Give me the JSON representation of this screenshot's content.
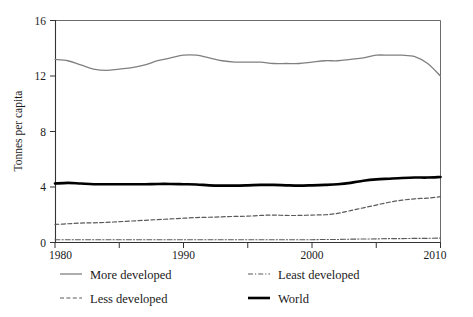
{
  "chart_data": {
    "type": "line",
    "title": "",
    "subtitle": "",
    "xlabel": "",
    "ylabel": "Tonnes per capita",
    "xlim": [
      1980,
      2010
    ],
    "ylim": [
      0,
      16
    ],
    "xticks": [
      1980,
      1985,
      1990,
      1995,
      2000,
      2005,
      2010
    ],
    "xtick_labels": [
      "1980",
      "",
      "1990",
      "",
      "2000",
      "",
      "2010"
    ],
    "yticks": [
      0,
      4,
      8,
      12,
      16
    ],
    "ytick_labels": [
      "0",
      "4",
      "8",
      "12",
      "16"
    ],
    "grid": false,
    "legend_position": "below",
    "x": [
      1980,
      1981,
      1982,
      1983,
      1984,
      1985,
      1986,
      1987,
      1988,
      1989,
      1990,
      1991,
      1992,
      1993,
      1994,
      1995,
      1996,
      1997,
      1998,
      1999,
      2000,
      2001,
      2002,
      2003,
      2004,
      2005,
      2006,
      2007,
      2008,
      2009,
      2010
    ],
    "series": [
      {
        "name": "More developed",
        "style": "solid",
        "color": "#808080",
        "width": 1.3,
        "values": [
          13.2,
          13.1,
          12.8,
          12.5,
          12.4,
          12.5,
          12.6,
          12.8,
          13.1,
          13.3,
          13.5,
          13.5,
          13.3,
          13.1,
          13.0,
          13.0,
          13.0,
          12.9,
          12.9,
          12.9,
          13.0,
          13.1,
          13.1,
          13.2,
          13.3,
          13.5,
          13.5,
          13.5,
          13.4,
          12.9,
          12.0
        ]
      },
      {
        "name": "Less developed",
        "style": "dashed",
        "color": "#5a5a5a",
        "width": 1.2,
        "values": [
          1.3,
          1.35,
          1.4,
          1.42,
          1.45,
          1.5,
          1.55,
          1.6,
          1.65,
          1.7,
          1.75,
          1.8,
          1.82,
          1.85,
          1.88,
          1.9,
          1.95,
          1.98,
          1.95,
          1.95,
          1.98,
          2.0,
          2.1,
          2.3,
          2.5,
          2.7,
          2.9,
          3.05,
          3.15,
          3.2,
          3.3
        ]
      },
      {
        "name": "Least developed",
        "style": "dashdot",
        "color": "#5a5a5a",
        "width": 1.1,
        "values": [
          0.2,
          0.2,
          0.2,
          0.2,
          0.2,
          0.2,
          0.2,
          0.2,
          0.2,
          0.2,
          0.2,
          0.2,
          0.2,
          0.2,
          0.2,
          0.2,
          0.2,
          0.2,
          0.2,
          0.2,
          0.2,
          0.22,
          0.22,
          0.24,
          0.25,
          0.26,
          0.28,
          0.28,
          0.3,
          0.3,
          0.32
        ]
      },
      {
        "name": "World",
        "style": "solid",
        "color": "#000000",
        "width": 2.6,
        "values": [
          4.25,
          4.3,
          4.25,
          4.2,
          4.2,
          4.2,
          4.2,
          4.2,
          4.22,
          4.22,
          4.2,
          4.18,
          4.12,
          4.1,
          4.1,
          4.12,
          4.15,
          4.15,
          4.12,
          4.1,
          4.12,
          4.15,
          4.2,
          4.3,
          4.45,
          4.55,
          4.6,
          4.65,
          4.68,
          4.68,
          4.72
        ]
      }
    ]
  },
  "legend": {
    "items": [
      {
        "label": "More developed",
        "style": "solid",
        "color": "#808080",
        "width": 1.3
      },
      {
        "label": "Least developed",
        "style": "dashdot",
        "color": "#5a5a5a",
        "width": 1.1
      },
      {
        "label": "Less developed",
        "style": "dashed",
        "color": "#5a5a5a",
        "width": 1.2
      },
      {
        "label": "World",
        "style": "solid",
        "color": "#000000",
        "width": 2.6
      }
    ]
  }
}
